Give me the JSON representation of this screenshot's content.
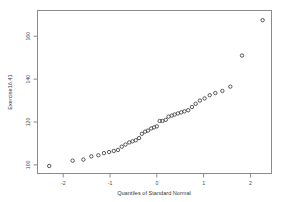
{
  "chart": {
    "type_name": "normal-qq-plot",
    "title": "",
    "frame_color": "#8a8a8a",
    "point_color": "#3d3d3d"
  },
  "chart_data": {
    "type": "scatter",
    "title": "",
    "subtitle": "",
    "xlabel": "Quantiles of Standard Normal",
    "ylabel": "Exercise16.41",
    "xlim": [
      -2.55,
      2.45
    ],
    "ylim": [
      96,
      172
    ],
    "grid": false,
    "legend": null,
    "xticks": [
      -2,
      -1,
      0,
      1,
      2
    ],
    "xticklabels": [
      "-2",
      "-1",
      "0",
      "1",
      "2"
    ],
    "yticks": [
      100,
      120,
      140,
      160
    ],
    "yticklabels": [
      "100",
      "120",
      "140",
      "160"
    ],
    "marker": "open-circle",
    "series": [
      {
        "name": "sample quantiles",
        "x": [
          -2.3,
          -1.8,
          -1.57,
          -1.4,
          -1.25,
          -1.13,
          -1.02,
          -0.92,
          -0.83,
          -0.75,
          -0.67,
          -0.59,
          -0.52,
          -0.45,
          -0.38,
          -0.32,
          -0.25,
          -0.19,
          -0.12,
          -0.06,
          0.0,
          0.06,
          0.12,
          0.19,
          0.25,
          0.32,
          0.38,
          0.45,
          0.52,
          0.59,
          0.67,
          0.75,
          0.83,
          0.92,
          1.02,
          1.13,
          1.25,
          1.4,
          1.57,
          1.82,
          2.26
        ],
        "y": [
          99.5,
          102.0,
          102.5,
          104.0,
          104.5,
          105.5,
          106.0,
          106.5,
          107.0,
          108.5,
          109.5,
          110.5,
          111.0,
          111.5,
          112.5,
          114.5,
          115.5,
          116.0,
          117.0,
          117.5,
          118.0,
          120.5,
          120.5,
          121.0,
          122.5,
          123.0,
          123.5,
          124.0,
          124.5,
          125.0,
          125.5,
          127.0,
          128.5,
          130.0,
          131.0,
          132.5,
          133.5,
          134.5,
          136.5,
          151.0,
          167.5
        ]
      }
    ]
  }
}
